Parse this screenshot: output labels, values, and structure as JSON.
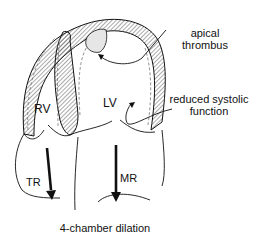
{
  "diagram": {
    "type": "medical-illustration",
    "caption": "4-chamber dilation",
    "chambers": {
      "rv": "RV",
      "lv": "LV"
    },
    "flows": {
      "tr": "TR",
      "mr": "MR"
    },
    "annotations": {
      "apical_thrombus_line1": "apical",
      "apical_thrombus_line2": "thrombus",
      "reduced_function_line1": "reduced systolic",
      "reduced_function_line2": "function"
    },
    "colors": {
      "stroke": "#111111",
      "hatch": "#555555",
      "thrombus_fill": "#e6e6e6",
      "dashed_endocardium": "#777777"
    }
  }
}
